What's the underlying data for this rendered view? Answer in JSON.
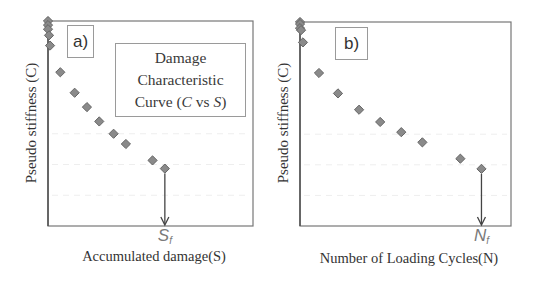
{
  "chart_data": [
    {
      "id": "a",
      "type": "scatter",
      "panel_label": "a)",
      "title": "",
      "annotation_box": {
        "line1": "Damage",
        "line2": "Characteristic",
        "line3_prefix": "Curve  (",
        "line3_var1": "C",
        "line3_mid": " vs ",
        "line3_var2": "S",
        "line3_suffix": ")"
      },
      "xlabel": "Accumulated damage(S)",
      "ylabel": "Pseudo stiffness (C)",
      "failure_marker": {
        "symbol": "S",
        "subscript": "f",
        "x": 0.57
      },
      "axis_units": "normalized (no numeric ticks shown)",
      "xlim": [
        0,
        1
      ],
      "ylim": [
        0,
        1
      ],
      "grid": false,
      "marker": {
        "shape": "diamond",
        "fill": "#8a8a8a",
        "stroke": "#666666"
      },
      "points": [
        {
          "x": 0.0,
          "y": 1.0
        },
        {
          "x": 0.0,
          "y": 0.98
        },
        {
          "x": 0.0,
          "y": 0.96
        },
        {
          "x": 0.005,
          "y": 0.93
        },
        {
          "x": 0.01,
          "y": 0.88
        },
        {
          "x": 0.06,
          "y": 0.75
        },
        {
          "x": 0.13,
          "y": 0.65
        },
        {
          "x": 0.19,
          "y": 0.58
        },
        {
          "x": 0.25,
          "y": 0.51
        },
        {
          "x": 0.32,
          "y": 0.45
        },
        {
          "x": 0.38,
          "y": 0.4
        },
        {
          "x": 0.51,
          "y": 0.32
        },
        {
          "x": 0.57,
          "y": 0.28
        }
      ]
    },
    {
      "id": "b",
      "type": "scatter",
      "panel_label": "b)",
      "title": "",
      "xlabel": "Number of Loading Cycles(N)",
      "ylabel": "Pseudo stiffness (C)",
      "failure_marker": {
        "symbol": "N",
        "subscript": "f",
        "x": 0.86
      },
      "axis_units": "normalized (no numeric ticks shown)",
      "xlim": [
        0,
        1
      ],
      "ylim": [
        0,
        1
      ],
      "grid": false,
      "marker": {
        "shape": "diamond",
        "fill": "#8a8a8a",
        "stroke": "#666666"
      },
      "points": [
        {
          "x": 0.0,
          "y": 1.0
        },
        {
          "x": 0.0,
          "y": 0.99
        },
        {
          "x": 0.0,
          "y": 0.97
        },
        {
          "x": 0.005,
          "y": 0.96
        },
        {
          "x": 0.014,
          "y": 0.9
        },
        {
          "x": 0.09,
          "y": 0.75
        },
        {
          "x": 0.18,
          "y": 0.65
        },
        {
          "x": 0.28,
          "y": 0.57
        },
        {
          "x": 0.38,
          "y": 0.51
        },
        {
          "x": 0.48,
          "y": 0.46
        },
        {
          "x": 0.58,
          "y": 0.41
        },
        {
          "x": 0.76,
          "y": 0.33
        },
        {
          "x": 0.86,
          "y": 0.28
        }
      ]
    }
  ],
  "layout": {
    "panels": [
      {
        "plot": {
          "left": 48,
          "top": 21,
          "width": 205,
          "height": 205
        },
        "tag_box": {
          "left": 67,
          "top": 25,
          "width": 27,
          "height": 33
        },
        "note_box": {
          "left": 115,
          "top": 43,
          "width": 131,
          "height": 74
        },
        "ylabel_center": {
          "x": 31,
          "y": 123
        },
        "xlabel_pos": {
          "x": 154,
          "y": 248
        },
        "fail_label_y": 226
      },
      {
        "plot": {
          "left": 300,
          "top": 22,
          "width": 211,
          "height": 204
        },
        "tag_box": {
          "left": 335,
          "top": 27,
          "width": 33,
          "height": 33
        },
        "note_box": null,
        "ylabel_center": {
          "x": 283,
          "y": 123
        },
        "xlabel_pos": {
          "x": 409,
          "y": 250
        },
        "fail_label_y": 226
      }
    ]
  }
}
